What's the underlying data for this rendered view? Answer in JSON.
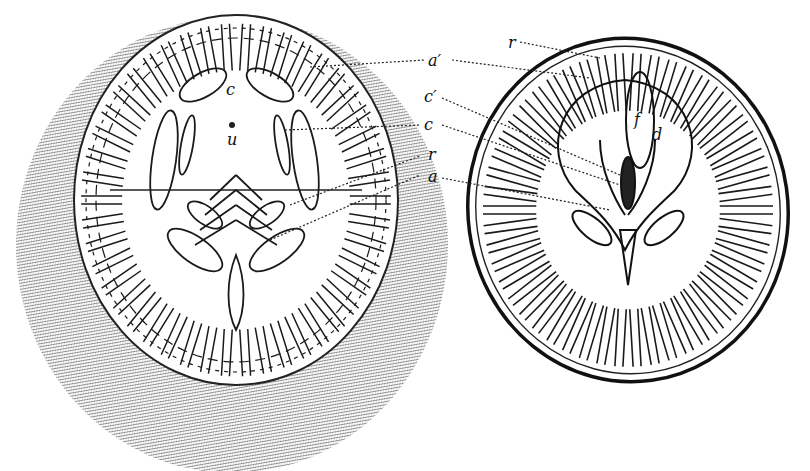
{
  "figure": {
    "ink_color": "#1a1a1a",
    "paper_color": "#ffffff",
    "left_view": {
      "labels": [
        {
          "id": "c",
          "text": "c"
        },
        {
          "id": "u",
          "text": "u"
        }
      ]
    },
    "right_view": {
      "labels": [
        {
          "id": "r_top",
          "text": "r"
        },
        {
          "id": "f",
          "text": "f"
        },
        {
          "id": "d",
          "text": "d"
        }
      ]
    },
    "leader_labels": [
      {
        "id": "a_prime",
        "text": "a′"
      },
      {
        "id": "c_prime",
        "text": "c′"
      },
      {
        "id": "c",
        "text": "c"
      },
      {
        "id": "r",
        "text": "r"
      },
      {
        "id": "a",
        "text": "a"
      }
    ]
  }
}
